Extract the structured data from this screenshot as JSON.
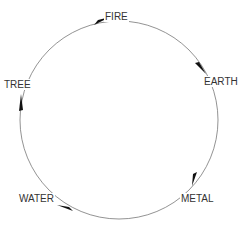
{
  "diagram": {
    "type": "cycle",
    "direction": "clockwise",
    "colors": {
      "line": "#777777",
      "arrow": "#111111",
      "text": "#333333"
    },
    "nodes": [
      {
        "id": "fire",
        "label": "FIRE"
      },
      {
        "id": "earth",
        "label": "EARTH"
      },
      {
        "id": "metal",
        "label": "METAL"
      },
      {
        "id": "water",
        "label": "WATER"
      },
      {
        "id": "tree",
        "label": "TREE"
      }
    ],
    "edges": [
      {
        "from": "FIRE",
        "to": "EARTH"
      },
      {
        "from": "EARTH",
        "to": "METAL"
      },
      {
        "from": "METAL",
        "to": "WATER"
      },
      {
        "from": "WATER",
        "to": "TREE"
      },
      {
        "from": "TREE",
        "to": "FIRE"
      }
    ]
  }
}
